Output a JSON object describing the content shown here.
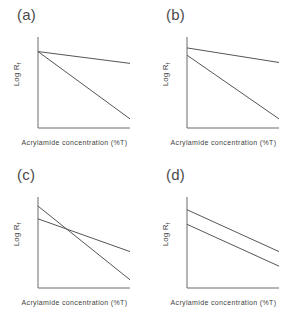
{
  "figure": {
    "background_color": "#ffffff",
    "line_color": "#555555",
    "axis_color": "#6a6a6a",
    "text_color": "#3f3f3f"
  },
  "axis_titles": {
    "x": "Acrylamide concentration (%T)",
    "y_prefix": "Log R",
    "y_subscript": "f"
  },
  "panels": [
    {
      "label": "(a)"
    },
    {
      "label": "(b)"
    },
    {
      "label": "(c)"
    },
    {
      "label": "(d)"
    }
  ],
  "chart_data": [
    {
      "type": "line",
      "title": "(a)",
      "xlabel": "Acrylamide concentration (%T)",
      "ylabel": "Log Rf",
      "xlim": [
        0,
        1
      ],
      "ylim": [
        0,
        1
      ],
      "grid": false,
      "legend": "none",
      "axis_ticks": [],
      "annotation": "Two lines sharing a common y-intercept with different slopes",
      "series": [
        {
          "name": "shallow-slope-line",
          "x": [
            0.0,
            1.0
          ],
          "y": [
            0.84,
            0.71
          ]
        },
        {
          "name": "steep-slope-line",
          "x": [
            0.0,
            1.0
          ],
          "y": [
            0.84,
            0.1
          ]
        }
      ]
    },
    {
      "type": "line",
      "title": "(b)",
      "xlabel": "Acrylamide concentration (%T)",
      "ylabel": "Log Rf",
      "xlim": [
        0,
        1
      ],
      "ylim": [
        0,
        1
      ],
      "grid": false,
      "legend": "none",
      "axis_ticks": [],
      "annotation": "Two lines with slightly different y-intercepts and different slopes, not crossing",
      "series": [
        {
          "name": "shallow-slope-line",
          "x": [
            0.0,
            1.0
          ],
          "y": [
            0.88,
            0.72
          ]
        },
        {
          "name": "steep-slope-line",
          "x": [
            0.0,
            1.0
          ],
          "y": [
            0.8,
            0.1
          ]
        }
      ]
    },
    {
      "type": "line",
      "title": "(c)",
      "xlabel": "Acrylamide concentration (%T)",
      "ylabel": "Log Rf",
      "xlim": [
        0,
        1
      ],
      "ylim": [
        0,
        1
      ],
      "grid": false,
      "legend": "none",
      "axis_ticks": [],
      "annotation": "Two lines crossing at an intermediate acrylamide concentration",
      "series": [
        {
          "name": "steep-slope-line",
          "x": [
            0.0,
            1.0
          ],
          "y": [
            0.9,
            0.09
          ]
        },
        {
          "name": "shallow-slope-line",
          "x": [
            0.0,
            1.0
          ],
          "y": [
            0.76,
            0.4
          ]
        }
      ]
    },
    {
      "type": "line",
      "title": "(d)",
      "xlabel": "Acrylamide concentration (%T)",
      "ylabel": "Log Rf",
      "xlim": [
        0,
        1
      ],
      "ylim": [
        0,
        1
      ],
      "grid": false,
      "legend": "none",
      "axis_ticks": [],
      "annotation": "Two parallel lines with different y-intercepts",
      "series": [
        {
          "name": "upper-parallel-line",
          "x": [
            0.0,
            1.0
          ],
          "y": [
            0.86,
            0.4
          ]
        },
        {
          "name": "lower-parallel-line",
          "x": [
            0.0,
            1.0
          ],
          "y": [
            0.7,
            0.24
          ]
        }
      ]
    }
  ]
}
